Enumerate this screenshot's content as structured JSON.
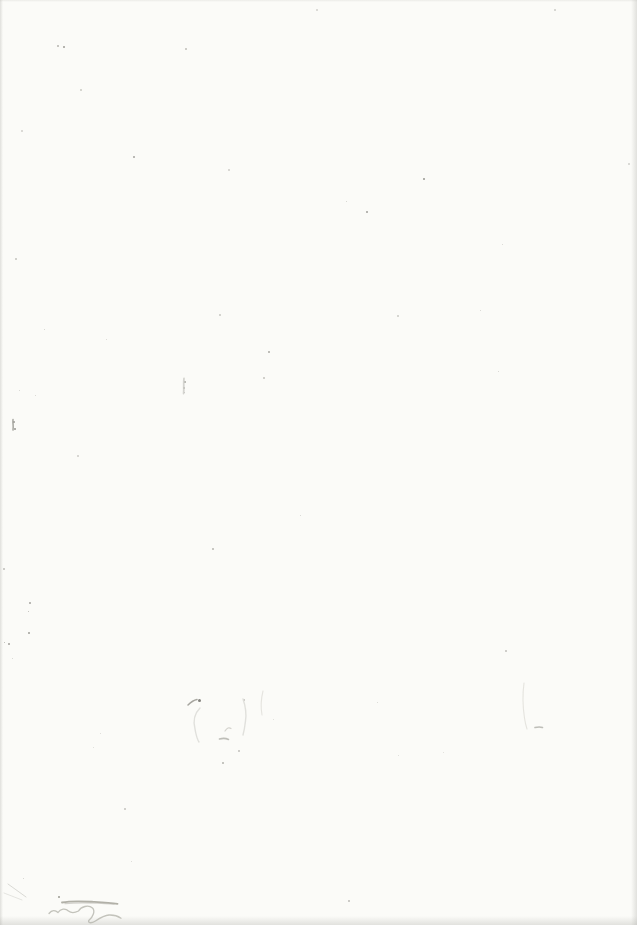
{
  "colors": {
    "paper": "#fbfbf8",
    "ghost_light": "#dededa",
    "pencil_light": "#b9b8b0",
    "pencil_medium": "#a3a299",
    "ink_dark": "#413f3a",
    "corner_smudge": "#d5d5d2",
    "edge_shadow": "#b4b4af"
  },
  "marks": {
    "specks": [
      {
        "x": 57,
        "y": 45,
        "s": 2,
        "c": "#a8a7a1"
      },
      {
        "x": 63,
        "y": 46,
        "s": 2,
        "c": "#8c8b85"
      },
      {
        "x": 185,
        "y": 48,
        "s": 2,
        "c": "#b3b2ac"
      },
      {
        "x": 80,
        "y": 89,
        "s": 2,
        "c": "#c0bfb9"
      },
      {
        "x": 21,
        "y": 130,
        "s": 2,
        "c": "#c8c7c2"
      },
      {
        "x": 133,
        "y": 156,
        "s": 2,
        "c": "#94938d"
      },
      {
        "x": 228,
        "y": 169,
        "s": 2,
        "c": "#c4c3be"
      },
      {
        "x": 316,
        "y": 9,
        "s": 2,
        "c": "#c9c8c3"
      },
      {
        "x": 423,
        "y": 178,
        "s": 2,
        "c": "#85847e"
      },
      {
        "x": 366,
        "y": 211,
        "s": 2,
        "c": "#8f8e88"
      },
      {
        "x": 346,
        "y": 201,
        "s": 1,
        "c": "#c6c5c0"
      },
      {
        "x": 554,
        "y": 9,
        "s": 2,
        "c": "#c2c1bc"
      },
      {
        "x": 628,
        "y": 163,
        "s": 2,
        "c": "#c6c5c1"
      },
      {
        "x": 502,
        "y": 244,
        "s": 1,
        "c": "#cbcac5"
      },
      {
        "x": 219,
        "y": 314,
        "s": 2,
        "c": "#bdbcb6"
      },
      {
        "x": 397,
        "y": 315,
        "s": 2,
        "c": "#c0bfba"
      },
      {
        "x": 268,
        "y": 351,
        "s": 2,
        "c": "#9b9a94"
      },
      {
        "x": 263,
        "y": 377,
        "s": 2,
        "c": "#b7b6b0"
      },
      {
        "x": 212,
        "y": 548,
        "s": 2,
        "c": "#a9a8a2"
      },
      {
        "x": 300,
        "y": 515,
        "s": 1,
        "c": "#c9c8c3"
      },
      {
        "x": 29,
        "y": 602,
        "s": 2,
        "c": "#94938d"
      },
      {
        "x": 28,
        "y": 611,
        "s": 1,
        "c": "#aaa9a3"
      },
      {
        "x": 28,
        "y": 632,
        "s": 2,
        "c": "#8e8d87"
      },
      {
        "x": 15,
        "y": 258,
        "s": 2,
        "c": "#b9b8b2"
      },
      {
        "x": 3,
        "y": 568,
        "s": 2,
        "c": "#b1b0ab"
      },
      {
        "x": 23,
        "y": 878,
        "s": 1,
        "c": "#c5c4bf"
      },
      {
        "x": 58,
        "y": 896,
        "s": 2,
        "c": "#8a897f"
      },
      {
        "x": 184,
        "y": 381,
        "s": 2,
        "c": "#97968f"
      },
      {
        "x": 183,
        "y": 387,
        "s": 2,
        "c": "#a3a29b"
      },
      {
        "x": 184,
        "y": 392,
        "s": 1,
        "c": "#b0afa9"
      },
      {
        "x": 13,
        "y": 421,
        "s": 2,
        "c": "#8b8a84"
      },
      {
        "x": 14,
        "y": 428,
        "s": 2,
        "c": "#84837d"
      },
      {
        "x": 44,
        "y": 329,
        "s": 1,
        "c": "#c6c5c0"
      },
      {
        "x": 19,
        "y": 390,
        "s": 1,
        "c": "#c9c8c3"
      },
      {
        "x": 35,
        "y": 395,
        "s": 1,
        "c": "#cac9c4"
      },
      {
        "x": 77,
        "y": 455,
        "s": 2,
        "c": "#c3c2bd"
      },
      {
        "x": 106,
        "y": 339,
        "s": 1,
        "c": "#cccbc6"
      },
      {
        "x": 498,
        "y": 371,
        "s": 1,
        "c": "#c8c7c2"
      },
      {
        "x": 480,
        "y": 310,
        "s": 1,
        "c": "#cac9c4"
      },
      {
        "x": 505,
        "y": 650,
        "s": 2,
        "c": "#b5b4ae"
      },
      {
        "x": 124,
        "y": 808,
        "s": 2,
        "c": "#b7b6b1"
      },
      {
        "x": 348,
        "y": 900,
        "s": 2,
        "c": "#b0afaa"
      },
      {
        "x": 131,
        "y": 861,
        "s": 1,
        "c": "#cfcec9"
      },
      {
        "x": 8,
        "y": 643,
        "s": 2,
        "c": "#908f89"
      },
      {
        "x": 4,
        "y": 642,
        "s": 1,
        "c": "#a5a49e"
      },
      {
        "x": 398,
        "y": 755,
        "s": 1,
        "c": "#d2d1cc"
      },
      {
        "x": 443,
        "y": 752,
        "s": 1,
        "c": "#d5d4cf"
      },
      {
        "x": 238,
        "y": 750,
        "s": 2,
        "c": "#b5b4ae"
      },
      {
        "x": 222,
        "y": 762,
        "s": 2,
        "c": "#a5a49f"
      },
      {
        "x": 273,
        "y": 719,
        "s": 1,
        "c": "#d4d3ce"
      },
      {
        "x": 198,
        "y": 699,
        "s": 3,
        "c": "#6e6d67"
      },
      {
        "x": 243,
        "y": 699,
        "s": 2,
        "c": "#b3b2ac"
      },
      {
        "x": 377,
        "y": 702,
        "s": 1,
        "c": "#cdccc7"
      },
      {
        "x": 12,
        "y": 658,
        "s": 1,
        "c": "#c9c8c3"
      },
      {
        "x": 100,
        "y": 733,
        "s": 1,
        "c": "#d0cfca"
      },
      {
        "x": 93,
        "y": 747,
        "s": 1,
        "c": "#d2d1cc"
      }
    ],
    "corner_smudge": {
      "path": "M0,8 C4,9.5 6.5,14 5.5,20 L5.2,33 C5,40 3,44.5 0,46 Z"
    },
    "faint_vertical_mark": {
      "path": "M184,378.5 C183.3,383 184.2,388 183.6,393.5"
    },
    "left_edge_mark": {
      "path": "M13,419.5 C12.5,423 13.8,426 13,430"
    },
    "ghost_smudge": {
      "check_stroke": "M188,705 C191,702 194,700 197,699.5",
      "arc": "M200,708 C195,713 193,721 195,729 C196,735 197,739 199,742",
      "small_check": "M225,731 C227,728 229,727 231,728.5",
      "blob": "M212.5,736 C214.5,733.5 218,734.5 219,737.5 C220,741 217.5,743.5 214.5,742.8 C211.5,742 211,738 212.5,736 Z",
      "blob_smudge": "M219.5,739 C223,738 226.5,738.5 228.5,739.5",
      "right_curve": "M243,699 C245.5,706 246.5,714 245.5,721 C244.8,727 243.8,732 243,735",
      "right_curve2": "M263,691 C261,699 260.5,707 262,715"
    },
    "ghost_mark_right": {
      "line": "M524,683 C522.5,694 522.8,707 524.5,718 C525,722 526,726 527,729",
      "blob": "M520.5,729.5 C522.5,725.5 527,723.5 531,724.5 L533.5,727.5 C529.5,730.5 524,731.5 520.5,731 Z",
      "tail": "M535,727.5 C538,726.8 540.5,726.8 542.5,727.5"
    },
    "pencil_scribble": {
      "strike": "M62,902.5 C72,900.5 83,901.2 93,901.8 C101,902.2 110,902.6 117.5,903.8",
      "strike_echo": "M65,903.6 C78,902.4 95,902.8 114,904.2",
      "cursive": "M49,913.5 C52,909.5 55.5,910 58,912.5 C60.5,908.5 65.5,908 68.5,911 C71.5,913.5 75.5,912.5 78.5,911 C81,906.5 88.5,904.5 92.5,908 C95.5,911 93,917 89,920.2 C87.5,922.5 90.5,924 95,921.2 C100,918 104.5,915.2 109,915 C113.5,914.8 118,916.2 121,918.2"
    },
    "corner_scratches": {
      "s1": "M8,884 C14,888 20,893 26,897",
      "s2": "M4,893 C10,895 16,898 22,900"
    }
  }
}
